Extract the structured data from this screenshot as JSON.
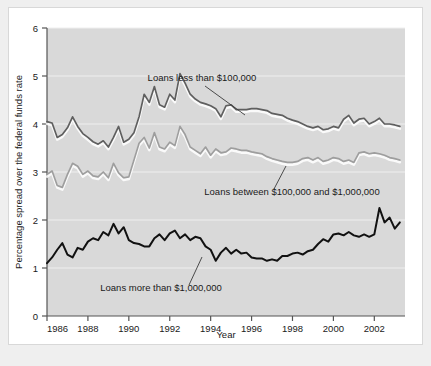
{
  "figure": {
    "background_color": "#ffffff",
    "plot_background_color": "#d9d9d9",
    "gridline_color": "#f0f0f0",
    "axis_color": "#555555"
  },
  "chart_data": {
    "type": "line",
    "title": "",
    "xlabel": "Year",
    "ylabel": "Percentage spread over the federal funds rate",
    "xlim": [
      1986,
      2003.5
    ],
    "ylim": [
      0,
      6
    ],
    "xticks": [
      1986,
      1988,
      1990,
      1992,
      1994,
      1996,
      1998,
      2000,
      2002
    ],
    "xtick_labels": [
      "1986",
      "1988",
      "1990",
      "1992",
      "1994",
      "1996",
      "1998",
      "2000",
      "2002"
    ],
    "yticks": [
      0,
      1,
      2,
      3,
      4,
      5,
      6
    ],
    "ytick_labels": [
      "0",
      "1",
      "2",
      "3",
      "4",
      "5",
      "6"
    ],
    "grid": true,
    "grid_axis": "y",
    "legend": "annotations-on-plot",
    "series": [
      {
        "name": "Loans less than $100,000",
        "color": "#5f5f5f",
        "width": 1.7,
        "x": [
          1986.0,
          1986.25,
          1986.5,
          1986.75,
          1987.0,
          1987.25,
          1987.5,
          1987.75,
          1988.0,
          1988.25,
          1988.5,
          1988.75,
          1989.0,
          1989.25,
          1989.5,
          1989.75,
          1990.0,
          1990.25,
          1990.5,
          1990.75,
          1991.0,
          1991.25,
          1991.5,
          1991.75,
          1992.0,
          1992.25,
          1992.5,
          1992.75,
          1993.0,
          1993.25,
          1993.5,
          1993.75,
          1994.0,
          1994.25,
          1994.5,
          1994.75,
          1995.0,
          1995.25,
          1995.5,
          1995.75,
          1996.0,
          1996.25,
          1996.5,
          1996.75,
          1997.0,
          1997.25,
          1997.5,
          1997.75,
          1998.0,
          1998.25,
          1998.5,
          1998.75,
          1999.0,
          1999.25,
          1999.5,
          1999.75,
          2000.0,
          2000.25,
          2000.5,
          2000.75,
          2001.0,
          2001.25,
          2001.5,
          2001.75,
          2002.0,
          2002.25,
          2002.5,
          2002.75,
          2003.0,
          2003.25
        ],
        "y": [
          4.05,
          4.02,
          3.72,
          3.78,
          3.92,
          4.15,
          3.95,
          3.8,
          3.72,
          3.63,
          3.58,
          3.65,
          3.52,
          3.72,
          3.95,
          3.62,
          3.68,
          3.82,
          4.15,
          4.62,
          4.45,
          4.78,
          4.4,
          4.35,
          4.62,
          4.5,
          5.05,
          4.85,
          4.62,
          4.52,
          4.45,
          4.42,
          4.38,
          4.32,
          4.15,
          4.38,
          4.4,
          4.3,
          4.3,
          4.3,
          4.32,
          4.32,
          4.3,
          4.28,
          4.22,
          4.2,
          4.18,
          4.12,
          4.08,
          4.05,
          4.0,
          3.95,
          3.92,
          3.95,
          3.88,
          3.9,
          3.95,
          3.92,
          4.1,
          4.18,
          4.02,
          4.1,
          4.12,
          4.0,
          4.05,
          4.12,
          4.0,
          4.0,
          3.98,
          3.95
        ]
      },
      {
        "name": "Loans between $100,000 and $1,000,000",
        "color": "#9e9e9e",
        "width": 1.7,
        "x": [
          1986.0,
          1986.25,
          1986.5,
          1986.75,
          1987.0,
          1987.25,
          1987.5,
          1987.75,
          1988.0,
          1988.25,
          1988.5,
          1988.75,
          1989.0,
          1989.25,
          1989.5,
          1989.75,
          1990.0,
          1990.25,
          1990.5,
          1990.75,
          1991.0,
          1991.25,
          1991.5,
          1991.75,
          1992.0,
          1992.25,
          1992.5,
          1992.75,
          1993.0,
          1993.25,
          1993.5,
          1993.75,
          1994.0,
          1994.25,
          1994.5,
          1994.75,
          1995.0,
          1995.25,
          1995.5,
          1995.75,
          1996.0,
          1996.25,
          1996.5,
          1996.75,
          1997.0,
          1997.25,
          1997.5,
          1997.75,
          1998.0,
          1998.25,
          1998.5,
          1998.75,
          1999.0,
          1999.25,
          1999.5,
          1999.75,
          2000.0,
          2000.25,
          2000.5,
          2000.75,
          2001.0,
          2001.25,
          2001.5,
          2001.75,
          2002.0,
          2002.25,
          2002.5,
          2002.75,
          2003.0,
          2003.25
        ],
        "y": [
          2.95,
          3.02,
          2.72,
          2.68,
          2.95,
          3.18,
          3.12,
          2.95,
          3.02,
          2.92,
          2.9,
          3.0,
          2.88,
          3.18,
          2.98,
          2.88,
          2.9,
          3.25,
          3.6,
          3.72,
          3.5,
          3.82,
          3.52,
          3.48,
          3.62,
          3.55,
          3.95,
          3.78,
          3.52,
          3.45,
          3.38,
          3.52,
          3.35,
          3.48,
          3.4,
          3.42,
          3.5,
          3.48,
          3.45,
          3.45,
          3.42,
          3.4,
          3.38,
          3.32,
          3.28,
          3.25,
          3.22,
          3.2,
          3.2,
          3.22,
          3.28,
          3.3,
          3.25,
          3.3,
          3.22,
          3.25,
          3.3,
          3.28,
          3.22,
          3.25,
          3.2,
          3.4,
          3.42,
          3.38,
          3.4,
          3.38,
          3.35,
          3.3,
          3.28,
          3.25
        ]
      },
      {
        "name": "Loans more than $1,000,000",
        "color": "#111111",
        "width": 2.0,
        "x": [
          1986.0,
          1986.25,
          1986.5,
          1986.75,
          1987.0,
          1987.25,
          1987.5,
          1987.75,
          1988.0,
          1988.25,
          1988.5,
          1988.75,
          1989.0,
          1989.25,
          1989.5,
          1989.75,
          1990.0,
          1990.25,
          1990.5,
          1990.75,
          1991.0,
          1991.25,
          1991.5,
          1991.75,
          1992.0,
          1992.25,
          1992.5,
          1992.75,
          1993.0,
          1993.25,
          1993.5,
          1993.75,
          1994.0,
          1994.25,
          1994.5,
          1994.75,
          1995.0,
          1995.25,
          1995.5,
          1995.75,
          1996.0,
          1996.25,
          1996.5,
          1996.75,
          1997.0,
          1997.25,
          1997.5,
          1997.75,
          1998.0,
          1998.25,
          1998.5,
          1998.75,
          1999.0,
          1999.25,
          1999.5,
          1999.75,
          2000.0,
          2000.25,
          2000.5,
          2000.75,
          2001.0,
          2001.25,
          2001.5,
          2001.75,
          2002.0,
          2002.25,
          2002.5,
          2002.75,
          2003.0,
          2003.25
        ],
        "y": [
          1.1,
          1.22,
          1.38,
          1.52,
          1.28,
          1.22,
          1.42,
          1.38,
          1.55,
          1.62,
          1.58,
          1.75,
          1.68,
          1.92,
          1.72,
          1.85,
          1.58,
          1.52,
          1.5,
          1.45,
          1.45,
          1.62,
          1.7,
          1.58,
          1.72,
          1.78,
          1.62,
          1.7,
          1.58,
          1.65,
          1.62,
          1.45,
          1.38,
          1.15,
          1.32,
          1.42,
          1.3,
          1.38,
          1.3,
          1.32,
          1.22,
          1.2,
          1.2,
          1.15,
          1.18,
          1.15,
          1.25,
          1.25,
          1.3,
          1.32,
          1.28,
          1.35,
          1.38,
          1.5,
          1.6,
          1.55,
          1.7,
          1.72,
          1.68,
          1.75,
          1.68,
          1.65,
          1.7,
          1.65,
          1.7,
          2.25,
          1.95,
          2.05,
          1.82,
          1.95
        ]
      }
    ],
    "annotations": [
      {
        "text": "Loans less than $100,000",
        "text_x": 193,
        "text_y": 73,
        "anchor": "middle",
        "leader": {
          "x1": 196,
          "y1": 78,
          "x2": 236,
          "y2": 107
        }
      },
      {
        "text": "Loans between $100,000 and $1,000,000",
        "text_x": 283,
        "text_y": 187,
        "anchor": "middle",
        "leader": {
          "x1": 265,
          "y1": 181,
          "x2": 277,
          "y2": 158
        }
      },
      {
        "text": "Loans more than $1,000,000",
        "text_x": 152,
        "text_y": 283,
        "anchor": "middle",
        "leader": {
          "x1": 180,
          "y1": 277,
          "x2": 193,
          "y2": 249
        }
      }
    ]
  }
}
